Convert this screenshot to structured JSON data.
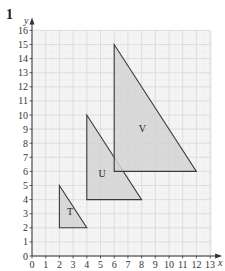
{
  "question": {
    "number": "1",
    "faint_header": "· · · ·"
  },
  "axes": {
    "x_label": "x",
    "y_label": "y",
    "x_min": 0,
    "x_max": 13,
    "y_min": 0,
    "y_max": 16,
    "x_ticks": [
      "0",
      "1",
      "2",
      "3",
      "4",
      "5",
      "6",
      "7",
      "8",
      "9",
      "10",
      "11",
      "12",
      "13"
    ],
    "y_ticks": [
      "0",
      "1",
      "2",
      "3",
      "4",
      "5",
      "6",
      "7",
      "8",
      "9",
      "10",
      "11",
      "12",
      "13",
      "14",
      "15",
      "16"
    ]
  },
  "grid": {
    "major_color": "#d8d8d8",
    "minor_color": "#ececec",
    "background": "#f4f4f4"
  },
  "shapes": [
    {
      "label": "T",
      "vertices": [
        [
          2,
          5
        ],
        [
          2,
          2
        ],
        [
          4,
          2
        ]
      ],
      "label_pos": [
        2.55,
        2.9
      ]
    },
    {
      "label": "U",
      "vertices": [
        [
          4,
          10
        ],
        [
          4,
          4
        ],
        [
          8,
          4
        ]
      ],
      "label_pos": [
        4.85,
        5.6
      ]
    },
    {
      "label": "V",
      "vertices": [
        [
          6,
          15
        ],
        [
          6,
          6
        ],
        [
          12,
          6
        ]
      ],
      "label_pos": [
        7.8,
        8.8
      ]
    }
  ],
  "colors": {
    "fill": "#d4d4d4",
    "stroke": "#3a3a3a",
    "axis": "#333333"
  },
  "chart_data": {
    "type": "scatter",
    "title": "",
    "xlabel": "x",
    "ylabel": "y",
    "xlim": [
      0,
      13
    ],
    "ylim": [
      0,
      16
    ],
    "grid": true,
    "series": [
      {
        "name": "T",
        "points": [
          [
            2,
            5
          ],
          [
            2,
            2
          ],
          [
            4,
            2
          ]
        ]
      },
      {
        "name": "U",
        "points": [
          [
            4,
            10
          ],
          [
            4,
            4
          ],
          [
            8,
            4
          ]
        ]
      },
      {
        "name": "V",
        "points": [
          [
            6,
            15
          ],
          [
            6,
            6
          ],
          [
            12,
            6
          ]
        ]
      }
    ]
  }
}
